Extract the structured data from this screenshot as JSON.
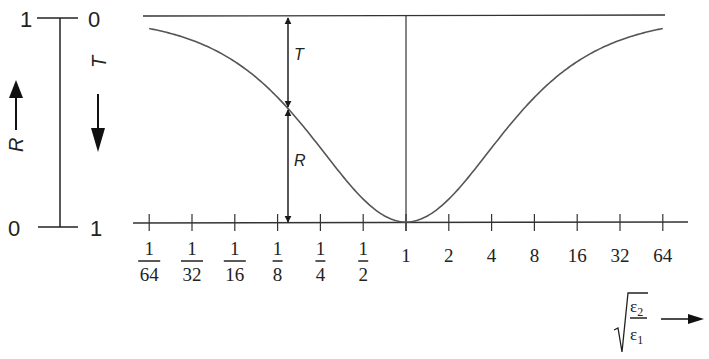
{
  "chart_data": {
    "type": "line",
    "title": "",
    "xlabel": "sqrt(ε2/ε1)",
    "xlabel_parts": {
      "numerator": "ε",
      "numerator_sub": "2",
      "denominator": "ε",
      "denominator_sub": "1"
    },
    "ylabel_left": "R",
    "ylabel_right": "T",
    "x_scale": "log2",
    "x_ticks": [
      {
        "value": 0.015625,
        "label_num": "1",
        "label_den": "64"
      },
      {
        "value": 0.03125,
        "label_num": "1",
        "label_den": "32"
      },
      {
        "value": 0.0625,
        "label_num": "1",
        "label_den": "16"
      },
      {
        "value": 0.125,
        "label_num": "1",
        "label_den": "8"
      },
      {
        "value": 0.25,
        "label_num": "1",
        "label_den": "4"
      },
      {
        "value": 0.5,
        "label_num": "1",
        "label_den": "2"
      },
      {
        "value": 1,
        "label": "1"
      },
      {
        "value": 2,
        "label": "2"
      },
      {
        "value": 4,
        "label": "4"
      },
      {
        "value": 8,
        "label": "8"
      },
      {
        "value": 16,
        "label": "16"
      },
      {
        "value": 32,
        "label": "32"
      },
      {
        "value": 64,
        "label": "64"
      }
    ],
    "y_left": {
      "label": "R",
      "top": "1",
      "bottom": "0"
    },
    "y_right": {
      "label": "T",
      "top": "0",
      "bottom": "1"
    },
    "ylim": [
      0,
      1
    ],
    "grid": false,
    "series": [
      {
        "name": "R",
        "formula": "R = ((n-1)/(n+1))^2, n = sqrt(ε2/ε1)",
        "x": [
          0.015625,
          0.03125,
          0.0625,
          0.125,
          0.25,
          0.5,
          1,
          2,
          4,
          8,
          16,
          32,
          64
        ],
        "values": [
          0.939,
          0.882,
          0.779,
          0.605,
          0.36,
          0.111,
          0,
          0.111,
          0.36,
          0.605,
          0.779,
          0.882,
          0.939
        ]
      }
    ],
    "annotations": [
      {
        "text": "T",
        "at_x": 0.125,
        "span": "from curve to top line"
      },
      {
        "text": "R",
        "at_x": 0.125,
        "span": "from axis to curve"
      }
    ]
  },
  "labels": {
    "left_top": "1",
    "left_bottom": "0",
    "right_top": "0",
    "right_bottom": "1",
    "R_axis": "R",
    "T_axis": "T",
    "T_annot": "T",
    "R_annot": "R"
  }
}
